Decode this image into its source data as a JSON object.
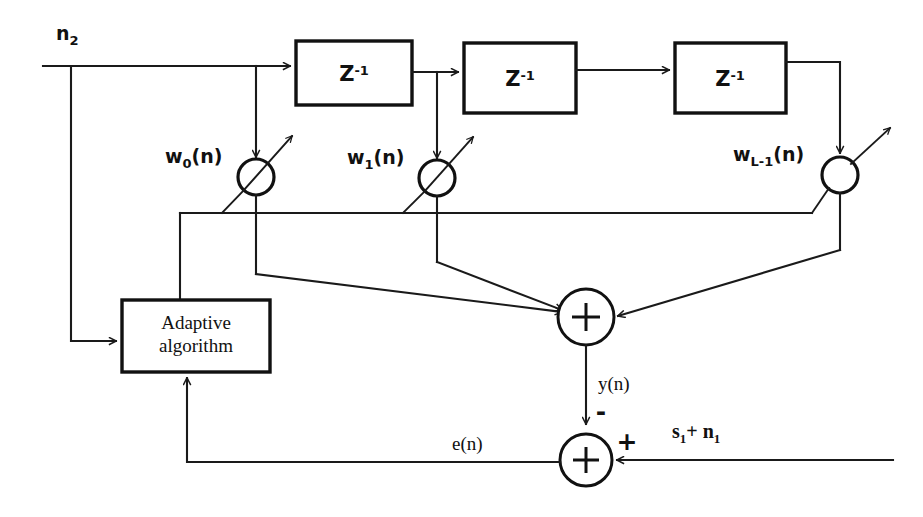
{
  "diagram": {
    "ink_color": "#111111",
    "background_color": "#ffffff",
    "inputs": {
      "reference_noise": "n2",
      "reference_noise_base": "n",
      "reference_noise_sub": "2",
      "primary_signal": "s1+ n1",
      "primary_signal_parts": {
        "s_base": "s",
        "s_sub": "1",
        "operator": "+",
        "n_base": "n",
        "n_sub": "1"
      }
    },
    "delay_blocks": [
      {
        "label": "Z",
        "exponent": "-1",
        "name": "delay-1"
      },
      {
        "label": "Z",
        "exponent": "-1",
        "name": "delay-2"
      },
      {
        "label": "Z",
        "exponent": "-1",
        "name": "delay-3"
      }
    ],
    "weights": [
      {
        "label": "w",
        "sub": "0",
        "suffix": "(n)",
        "full": "w0(n)"
      },
      {
        "label": "w",
        "sub": "1",
        "suffix": "(n)",
        "full": "w1(n)"
      },
      {
        "label": "w",
        "sub": "L-1",
        "suffix": "(n)",
        "full": "wL-1(n)"
      }
    ],
    "adaptive_block": {
      "line1": "Adaptive",
      "line2": "algorithm"
    },
    "summers": [
      {
        "name": "output-summer",
        "glyph": "+",
        "output_label": "y(n)"
      },
      {
        "name": "error-summer",
        "glyph": "+",
        "output_label": "e(n)"
      }
    ],
    "signs": {
      "y_into_error_summer": "-",
      "primary_into_error_summer": "+"
    },
    "signals": {
      "filter_output": "y(n)",
      "error_output": "e(n)"
    }
  }
}
